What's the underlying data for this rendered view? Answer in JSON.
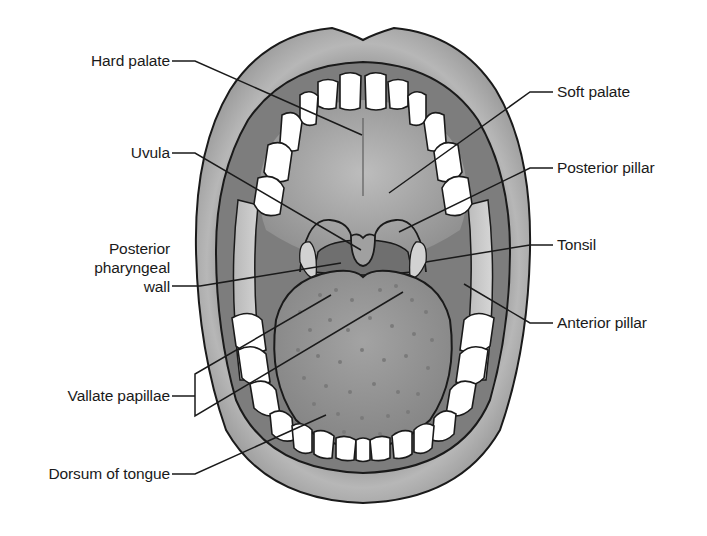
{
  "diagram": {
    "labels_left": [
      {
        "id": "hard-palate",
        "text": "Hard palate"
      },
      {
        "id": "uvula",
        "text": "Uvula"
      },
      {
        "id": "posterior-pharyngeal-wall",
        "lines": [
          "Posterior",
          "pharyngeal",
          "wall"
        ]
      },
      {
        "id": "vallate-papillae",
        "text": "Vallate papillae"
      },
      {
        "id": "dorsum-of-tongue",
        "text": "Dorsum of tongue"
      }
    ],
    "labels_right": [
      {
        "id": "soft-palate",
        "text": "Soft palate"
      },
      {
        "id": "posterior-pillar",
        "text": "Posterior pillar"
      },
      {
        "id": "tonsil",
        "text": "Tonsil"
      },
      {
        "id": "anterior-pillar",
        "text": "Anterior pillar"
      }
    ]
  },
  "colors": {
    "background": "#ffffff",
    "lips": "#a9a9a9",
    "palate": "#a6a6a6",
    "oral_cavity_dark": "#7f7f7f",
    "tongue": "#9a9a9a",
    "teeth": "#ffffff",
    "outline": "#1a1a1a"
  }
}
